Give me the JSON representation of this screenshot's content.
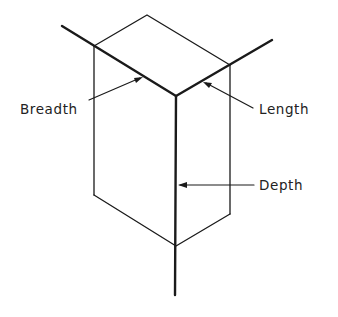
{
  "diagram": {
    "title": "",
    "labels": {
      "breadth": "Breadth",
      "length": "Length",
      "depth": "Depth"
    },
    "colors": {
      "line": "#1a1a1a",
      "text": "#222222",
      "background": "#ffffff"
    }
  }
}
